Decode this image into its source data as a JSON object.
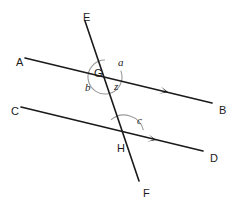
{
  "figure": {
    "kind": "geometry-diagram",
    "background_color": "#ffffff",
    "line_color": "#1a1a1a",
    "arc_color": "#9a9a9a",
    "label_color": "#1a1a1a",
    "width": 228,
    "height": 201
  },
  "points": [
    {
      "name": "A",
      "label": "A",
      "x": 16,
      "y": 57
    },
    {
      "name": "B",
      "label": "B",
      "x": 219,
      "y": 105
    },
    {
      "name": "C",
      "label": "C",
      "x": 11,
      "y": 106
    },
    {
      "name": "D",
      "label": "D",
      "x": 210,
      "y": 153
    },
    {
      "name": "E",
      "label": "E",
      "x": 83,
      "y": 12
    },
    {
      "name": "F",
      "label": "F",
      "x": 143,
      "y": 188
    },
    {
      "name": "G",
      "label": "G",
      "x": 94,
      "y": 68
    },
    {
      "name": "H",
      "label": "H",
      "x": 117,
      "y": 143
    }
  ],
  "lines": [
    {
      "name": "line-AB",
      "from": "A",
      "to": "B",
      "x1": 25,
      "y1": 58,
      "x2": 212,
      "y2": 103,
      "arrow": true,
      "arrow_at": {
        "x": 168,
        "y": 92
      }
    },
    {
      "name": "line-CD",
      "from": "C",
      "to": "D",
      "x1": 21,
      "y1": 107,
      "x2": 203,
      "y2": 151,
      "arrow": true,
      "arrow_at": {
        "x": 156,
        "y": 140
      }
    },
    {
      "name": "line-EF",
      "from": "E",
      "to": "F",
      "x1": 85,
      "y1": 21,
      "x2": 139,
      "y2": 181,
      "arrow": false
    }
  ],
  "intersections": [
    {
      "name": "G",
      "x": 105,
      "y": 77,
      "lines": [
        "line-AB",
        "line-EF"
      ]
    },
    {
      "name": "H",
      "x": 124,
      "y": 135,
      "lines": [
        "line-CD",
        "line-EF"
      ]
    }
  ],
  "angles": [
    {
      "name": "angle-a",
      "label": "a",
      "at": "G",
      "label_x": 118,
      "label_y": 57
    },
    {
      "name": "angle-b",
      "label": "b",
      "at": "G",
      "label_x": 85,
      "label_y": 82
    },
    {
      "name": "angle-z",
      "label": "z",
      "at": "G",
      "label_x": 114,
      "label_y": 81
    },
    {
      "name": "angle-c",
      "label": "c",
      "at": "H",
      "label_x": 137,
      "label_y": 115
    }
  ],
  "arcs": [
    {
      "name": "arc-at-G",
      "center_x": 105,
      "center_y": 77,
      "radius": 17,
      "start_deg": -22,
      "sweep_deg": 292
    },
    {
      "name": "arc-at-H",
      "center_x": 124,
      "center_y": 135,
      "radius": 20,
      "start_deg": -14,
      "sweep_deg": -117
    }
  ]
}
